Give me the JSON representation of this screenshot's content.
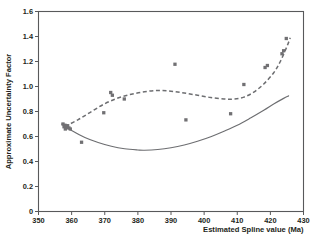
{
  "chart_data": {
    "type": "scatter",
    "title": "",
    "xlabel": "Estimated Spline value (Ma)",
    "ylabel": "Approximate Uncertainty Factor",
    "xlim": [
      350,
      430
    ],
    "ylim": [
      0,
      1.6
    ],
    "xticks": [
      350,
      360,
      370,
      380,
      390,
      400,
      410,
      420,
      430
    ],
    "yticks": [
      "0",
      "0.2",
      "0.4",
      "0.6",
      "0.8",
      "1.0",
      "1.2",
      "1.4",
      "1.6"
    ],
    "ytick_values": [
      0,
      0.2,
      0.4,
      0.6,
      0.8,
      1.0,
      1.2,
      1.4,
      1.6
    ],
    "grid": false,
    "legend": "none",
    "marker_color": "#717073",
    "line_color": "#6d6e71",
    "frame_color": "#58595b",
    "points": [
      {
        "x": 357.4,
        "y": 0.7
      },
      {
        "x": 357.7,
        "y": 0.678
      },
      {
        "x": 358.0,
        "y": 0.69
      },
      {
        "x": 358.1,
        "y": 0.66
      },
      {
        "x": 358.4,
        "y": 0.672
      },
      {
        "x": 358.8,
        "y": 0.686
      },
      {
        "x": 359.2,
        "y": 0.668
      },
      {
        "x": 359.6,
        "y": 0.66
      },
      {
        "x": 363.0,
        "y": 0.554
      },
      {
        "x": 369.7,
        "y": 0.79
      },
      {
        "x": 371.8,
        "y": 0.952
      },
      {
        "x": 372.3,
        "y": 0.93
      },
      {
        "x": 375.9,
        "y": 0.9
      },
      {
        "x": 391.2,
        "y": 1.178
      },
      {
        "x": 394.5,
        "y": 0.733
      },
      {
        "x": 408.0,
        "y": 0.782
      },
      {
        "x": 412.0,
        "y": 1.016
      },
      {
        "x": 418.4,
        "y": 1.152
      },
      {
        "x": 419.1,
        "y": 1.168
      },
      {
        "x": 423.5,
        "y": 1.262
      },
      {
        "x": 424.0,
        "y": 1.286
      },
      {
        "x": 424.8,
        "y": 1.384
      }
    ],
    "series": [
      {
        "name": "upper-trend",
        "style": "dashed",
        "points": [
          {
            "x": 358.0,
            "y": 0.68
          },
          {
            "x": 362.0,
            "y": 0.735
          },
          {
            "x": 366.0,
            "y": 0.8
          },
          {
            "x": 370.0,
            "y": 0.862
          },
          {
            "x": 374.0,
            "y": 0.908
          },
          {
            "x": 378.0,
            "y": 0.938
          },
          {
            "x": 382.0,
            "y": 0.958
          },
          {
            "x": 386.0,
            "y": 0.968
          },
          {
            "x": 390.0,
            "y": 0.962
          },
          {
            "x": 394.0,
            "y": 0.948
          },
          {
            "x": 398.0,
            "y": 0.93
          },
          {
            "x": 402.0,
            "y": 0.912
          },
          {
            "x": 406.0,
            "y": 0.9
          },
          {
            "x": 409.0,
            "y": 0.9
          },
          {
            "x": 412.0,
            "y": 0.915
          },
          {
            "x": 415.0,
            "y": 0.955
          },
          {
            "x": 418.0,
            "y": 1.02
          },
          {
            "x": 421.0,
            "y": 1.11
          },
          {
            "x": 423.0,
            "y": 1.2
          },
          {
            "x": 425.0,
            "y": 1.32
          },
          {
            "x": 426.0,
            "y": 1.39
          }
        ]
      },
      {
        "name": "lower-trend",
        "style": "solid",
        "points": [
          {
            "x": 357.0,
            "y": 0.7
          },
          {
            "x": 360.0,
            "y": 0.648
          },
          {
            "x": 364.0,
            "y": 0.592
          },
          {
            "x": 368.0,
            "y": 0.552
          },
          {
            "x": 372.0,
            "y": 0.522
          },
          {
            "x": 376.0,
            "y": 0.502
          },
          {
            "x": 380.0,
            "y": 0.492
          },
          {
            "x": 382.0,
            "y": 0.49
          },
          {
            "x": 386.0,
            "y": 0.496
          },
          {
            "x": 390.0,
            "y": 0.51
          },
          {
            "x": 394.0,
            "y": 0.532
          },
          {
            "x": 398.0,
            "y": 0.562
          },
          {
            "x": 402.0,
            "y": 0.598
          },
          {
            "x": 406.0,
            "y": 0.642
          },
          {
            "x": 410.0,
            "y": 0.69
          },
          {
            "x": 414.0,
            "y": 0.748
          },
          {
            "x": 418.0,
            "y": 0.81
          },
          {
            "x": 421.0,
            "y": 0.86
          },
          {
            "x": 424.0,
            "y": 0.905
          },
          {
            "x": 425.5,
            "y": 0.925
          }
        ]
      }
    ]
  }
}
